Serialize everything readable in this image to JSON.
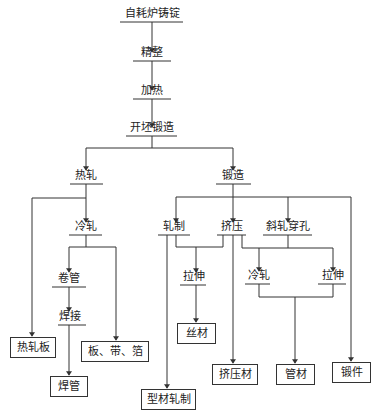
{
  "diagram": {
    "type": "process-flowchart",
    "line_color": "#333333",
    "nodes": {
      "ingot": "自耗炉铸锭",
      "finishing": "精整",
      "heating": "加热",
      "billet_forging": "开坯锻造",
      "hot_rolling": "热轧",
      "forging": "锻造",
      "cold_rolling_left": "冷轧",
      "tube_rolling": "卷管",
      "welding": "焊接",
      "rolling": "轧制",
      "extrusion": "挤压",
      "cross_piercing": "斜轧穿孔",
      "drawing_left": "拉伸",
      "cold_rolling_right": "冷轧",
      "drawing_right": "拉伸"
    },
    "products": {
      "hot_rolled_plate": "热轧板",
      "plate_strip_foil": "板、带、箔",
      "welded_tube": "焊管",
      "section_rolling": "型材轧制",
      "wire": "丝材",
      "extruded_profile": "挤压材",
      "tube": "管材",
      "forging_part": "锻件"
    }
  }
}
